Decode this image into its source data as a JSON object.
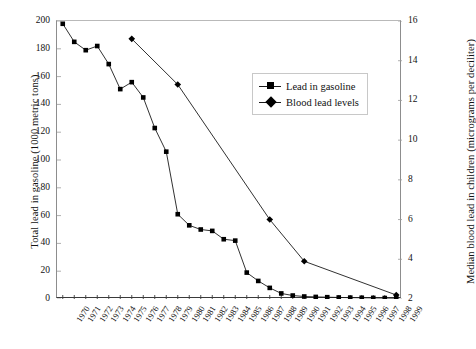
{
  "chart_data": {
    "type": "line",
    "title": "",
    "xlabel": "",
    "ylabel": "Total lead in gasoline (1000 metric tons)",
    "y2label": "Median blood lead in children (micrograms per deciliter)",
    "grid": false,
    "legend_position": "upper-right-inside",
    "categories": [
      "1970",
      "1971",
      "1972",
      "1973",
      "1974",
      "1975",
      "1976",
      "1977",
      "1978",
      "1979",
      "1980",
      "1981",
      "1982",
      "1983",
      "1984",
      "1985",
      "1986",
      "1987",
      "1988",
      "1989",
      "1990",
      "1991",
      "1992",
      "1993",
      "1994",
      "1995",
      "1996",
      "1997",
      "1998",
      "1999"
    ],
    "ylim": [
      0,
      200
    ],
    "yticks": [
      0,
      20,
      40,
      60,
      80,
      100,
      120,
      140,
      160,
      180,
      200
    ],
    "y2lim": [
      2,
      16
    ],
    "y2ticks": [
      2,
      4,
      6,
      8,
      10,
      12,
      14,
      16
    ],
    "series": [
      {
        "name": "Lead in gasoline",
        "axis": "left",
        "marker": "square",
        "color": "#000000",
        "x": [
          "1970",
          "1971",
          "1972",
          "1973",
          "1974",
          "1975",
          "1976",
          "1977",
          "1978",
          "1979",
          "1980",
          "1981",
          "1982",
          "1983",
          "1984",
          "1985",
          "1986",
          "1987",
          "1988",
          "1989",
          "1990",
          "1991",
          "1992",
          "1993",
          "1994",
          "1995",
          "1996",
          "1997",
          "1998",
          "1999"
        ],
        "values": [
          198,
          185,
          179,
          182,
          169,
          151,
          156,
          145,
          123,
          106,
          61,
          53,
          50,
          49,
          43,
          42,
          19,
          13,
          8,
          4,
          2.5,
          1.8,
          1.5,
          1.3,
          1.1,
          1.0,
          0.9,
          0.8,
          0.7,
          0.6
        ]
      },
      {
        "name": "Blood lead levels",
        "axis": "right",
        "marker": "diamond",
        "color": "#000000",
        "x": [
          "1976",
          "1980",
          "1988",
          "1991",
          "1999"
        ],
        "values": [
          15.1,
          12.8,
          6.0,
          3.9,
          2.2
        ]
      }
    ]
  },
  "axes": {
    "left": {
      "title": "Total lead in gasoline (1000 metric tons)",
      "ticks": [
        "0",
        "20",
        "40",
        "60",
        "80",
        "100",
        "120",
        "140",
        "160",
        "180",
        "200"
      ]
    },
    "right": {
      "title": "Median blood lead in children (micrograms per deciliter)",
      "ticks": [
        "2",
        "4",
        "6",
        "8",
        "10",
        "12",
        "14",
        "16"
      ]
    },
    "bottom": {
      "ticks": [
        "1970",
        "1971",
        "1972",
        "1973",
        "1974",
        "1975",
        "1976",
        "1977",
        "1978",
        "1979",
        "1980",
        "1981",
        "1982",
        "1983",
        "1984",
        "1985",
        "1986",
        "1987",
        "1988",
        "1989",
        "1990",
        "1991",
        "1992",
        "1993",
        "1994",
        "1995",
        "1996",
        "1997",
        "1998",
        "1999"
      ]
    }
  },
  "legend": {
    "items": [
      {
        "label": "Lead in gasoline",
        "marker": "square"
      },
      {
        "label": "Blood lead levels",
        "marker": "diamond"
      }
    ]
  },
  "colors": {
    "line": "#1a1a1a",
    "marker": "#000000",
    "axis": "#3a3a3a",
    "frame": "#b9b9b9",
    "background": "#ffffff"
  }
}
